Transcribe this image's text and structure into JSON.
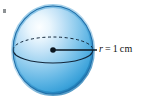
{
  "figure": {
    "type": "geometry-diagram",
    "background_color": "#ffffff",
    "sphere": {
      "center_x": 53,
      "center_y": 50,
      "radius_x": 40,
      "radius_y": 44,
      "fill_colors": {
        "highlight": "#fbfdfe",
        "light": "#cfe7f6",
        "mid": "#7cc3ea",
        "edge": "#2f9ad6",
        "rim": "#1b7fc0"
      },
      "outline_color": "#1f6ea8"
    },
    "equator": {
      "back_half_style": "dashed",
      "front_half_style": "solid",
      "stroke_color": "#12263a"
    },
    "center_point": {
      "label": "center-dot",
      "color": "#0b1620",
      "x": 53,
      "y": 50,
      "size": 5
    },
    "radius_line": {
      "color": "#0b1620",
      "from_x": 53,
      "from_y": 50,
      "to_x": 96,
      "to_y": 50
    },
    "radius_label": {
      "variable": "r",
      "equals": "=",
      "value": "1",
      "unit": "cm",
      "full_text": "r = 1 cm",
      "color": "#111111"
    },
    "corner_mark": {
      "present": true,
      "color": "#7a7f83"
    }
  }
}
